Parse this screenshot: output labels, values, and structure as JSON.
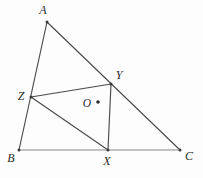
{
  "figure": {
    "canvas": {
      "width": 203,
      "height": 178,
      "background": "#fdfdfd"
    },
    "stroke_color": "#4a4a4a",
    "baseline_color": "#8a8a8a",
    "label_color": "#2b2b2b",
    "points": [
      {
        "id": "A",
        "label": "A",
        "x": 47,
        "y": 22,
        "label_x": 43,
        "label_y": 11,
        "dot": true
      },
      {
        "id": "B",
        "label": "B",
        "x": 19,
        "y": 150,
        "label_x": 11,
        "label_y": 159,
        "dot": true
      },
      {
        "id": "C",
        "label": "C",
        "x": 180,
        "y": 150,
        "label_x": 189,
        "label_y": 157,
        "dot": true
      },
      {
        "id": "X",
        "label": "X",
        "x": 108,
        "y": 150,
        "label_x": 107,
        "label_y": 162,
        "dot": true
      },
      {
        "id": "Y",
        "label": "Y",
        "x": 111,
        "y": 84,
        "label_x": 119,
        "label_y": 76,
        "dot": true
      },
      {
        "id": "Z",
        "label": "Z",
        "x": 31,
        "y": 97,
        "label_x": 21,
        "label_y": 97,
        "dot": true
      },
      {
        "id": "O",
        "label": "O",
        "x": 98,
        "y": 102,
        "label_x": 87,
        "label_y": 104,
        "dot": true
      }
    ],
    "segments": [
      {
        "id": "AB",
        "from": "A",
        "to": "B",
        "style": "dark"
      },
      {
        "id": "AC",
        "from": "A",
        "to": "C",
        "style": "dark"
      },
      {
        "id": "BC",
        "from": "B",
        "to": "C",
        "style": "light"
      },
      {
        "id": "ZY",
        "from": "Z",
        "to": "Y",
        "style": "dark"
      },
      {
        "id": "YX",
        "from": "Y",
        "to": "X",
        "style": "dark"
      },
      {
        "id": "ZX",
        "from": "Z",
        "to": "X",
        "style": "dark"
      }
    ]
  }
}
